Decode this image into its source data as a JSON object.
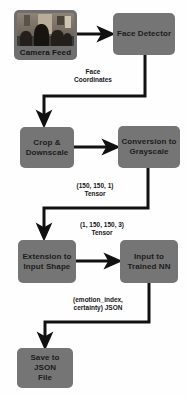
{
  "diagram": {
    "background_color": "#fefefe",
    "node_fill_color": "#757575",
    "connector_color": "#111111",
    "text_color": "#161616",
    "nodes": [
      {
        "id": "camera-feed",
        "label": "Camera Feed",
        "kind": "image-source",
        "thumbnail_description": "indoor room photo with several people"
      },
      {
        "id": "face-detector",
        "label": "Face Detector",
        "kind": "process"
      },
      {
        "id": "crop-downscale",
        "label": "Crop &\nDownscale",
        "kind": "process"
      },
      {
        "id": "conversion-grayscale",
        "label": "Conversion to\nGrayscale",
        "kind": "process"
      },
      {
        "id": "extension-input-shape",
        "label": "Extension to\nInput Shape",
        "kind": "process"
      },
      {
        "id": "input-trained-nn",
        "label": "Input to\nTrained NN",
        "kind": "process"
      },
      {
        "id": "save-json-file",
        "label": "Save to JSON\nFile",
        "kind": "output"
      }
    ],
    "edges": [
      {
        "id": "camera-to-detector",
        "from": "camera-feed",
        "to": "face-detector",
        "label": ""
      },
      {
        "id": "detector-to-crop",
        "from": "face-detector",
        "to": "crop-downscale",
        "label": "Face\nCoordinates"
      },
      {
        "id": "crop-to-grayscale",
        "from": "crop-downscale",
        "to": "conversion-grayscale",
        "label": ""
      },
      {
        "id": "grayscale-to-extension",
        "from": "conversion-grayscale",
        "to": "extension-input-shape",
        "label": "(150, 150, 1)\nTensor"
      },
      {
        "id": "extension-to-nn",
        "from": "extension-input-shape",
        "to": "input-trained-nn",
        "label": "(1, 150, 150, 3)\nTensor"
      },
      {
        "id": "nn-to-save",
        "from": "input-trained-nn",
        "to": "save-json-file",
        "label": "(emotion_index,\ncertainty) JSON"
      }
    ]
  }
}
